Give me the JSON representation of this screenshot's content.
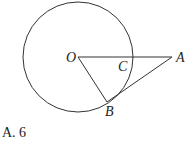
{
  "diagram": {
    "circle": {
      "cx": 78,
      "cy": 57,
      "r": 55
    },
    "points": {
      "O": {
        "label": "O",
        "x": 78,
        "y": 57
      },
      "A": {
        "label": "A",
        "x": 172,
        "y": 57
      },
      "B": {
        "label": "B",
        "x": 107,
        "y": 102
      },
      "C": {
        "label": "C",
        "x": 131,
        "y": 57
      }
    },
    "segments": [
      "OA",
      "OB",
      "AB"
    ],
    "stroke": "#333333"
  },
  "option": {
    "text": "A. 6"
  }
}
